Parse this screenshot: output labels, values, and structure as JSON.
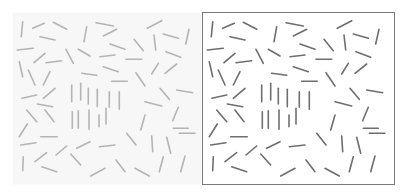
{
  "figure": {
    "panels": [
      {
        "id": "left",
        "stroke": "#b4b4b4",
        "border": false,
        "background": "#f7f7f7"
      },
      {
        "id": "right",
        "stroke": "#6e6e6e",
        "border": true,
        "border_color": "#7a7a7a",
        "background": "#ffffff"
      }
    ]
  },
  "segments": [
    [
      10.7,
      9.7,
      9.3,
      24.7
    ],
    [
      20.7,
      16.3,
      32.3,
      11.3
    ],
    [
      41.3,
      10.3,
      54.7,
      17.3
    ],
    [
      28,
      24.7,
      43,
      28
    ],
    [
      74.7,
      14.7,
      72,
      29.7
    ],
    [
      84,
      10.7,
      101.3,
      14
    ],
    [
      91.3,
      24,
      104.7,
      17.3
    ],
    [
      135.3,
      16.3,
      149.7,
      8.7
    ],
    [
      142,
      23,
      143.7,
      38
    ],
    [
      151.3,
      22,
      166.3,
      26.3
    ],
    [
      177,
      17.3,
      173.7,
      32
    ],
    [
      5.3,
      38,
      21.3,
      36.3
    ],
    [
      22,
      50.7,
      33,
      41.3
    ],
    [
      34,
      50.7,
      49.7,
      48.7
    ],
    [
      54,
      37.3,
      61.3,
      51.3
    ],
    [
      66.3,
      37.3,
      78,
      44
    ],
    [
      88,
      44.7,
      103,
      43
    ],
    [
      98,
      32,
      113,
      37.3
    ],
    [
      122,
      27.3,
      131.3,
      38.7
    ],
    [
      114,
      47.3,
      129.7,
      47.3
    ],
    [
      154,
      39.7,
      168.7,
      45.3
    ],
    [
      7.3,
      49.7,
      10.7,
      64.7
    ],
    [
      16.3,
      58,
      23,
      73
    ],
    [
      31.3,
      73,
      38,
      59.7
    ],
    [
      91.3,
      54.7,
      106.3,
      59.7
    ],
    [
      69.7,
      61.3,
      84.7,
      63.3
    ],
    [
      99.7,
      69.3,
      115.3,
      69.3
    ],
    [
      124,
      60.7,
      133,
      74
    ],
    [
      139.7,
      62,
      146.3,
      51.3
    ],
    [
      153,
      61.3,
      164.7,
      52
    ],
    [
      10,
      86.3,
      24.7,
      83
    ],
    [
      31.3,
      86.3,
      43,
      76.3
    ],
    [
      25.3,
      92,
      40.7,
      94.7
    ],
    [
      14.7,
      98,
      24.7,
      109.7
    ],
    [
      33,
      98,
      42,
      109.7
    ],
    [
      7.3,
      124.7,
      15.3,
      112
    ],
    [
      28.7,
      124.7,
      45.3,
      124.7
    ],
    [
      8.7,
      133,
      24,
      130.7
    ],
    [
      148,
      76.3,
      157.3,
      87.3
    ],
    [
      164.7,
      78,
      180.7,
      80.7
    ],
    [
      133,
      89.7,
      149.7,
      94
    ],
    [
      160.7,
      108.7,
      166.3,
      95.3
    ],
    [
      128.7,
      118,
      133,
      103
    ],
    [
      161.3,
      116.3,
      176.3,
      116.3
    ],
    [
      167.3,
      121.3,
      183,
      121.3
    ],
    [
      114.7,
      121.3,
      124,
      133
    ],
    [
      139.7,
      124,
      140.7,
      139.7
    ],
    [
      154.7,
      125.3,
      158.7,
      141.3
    ],
    [
      64.7,
      136.3,
      78,
      129.7
    ],
    [
      87.3,
      134.7,
      103,
      133
    ],
    [
      44,
      143,
      54.7,
      134
    ],
    [
      23,
      149.7,
      34.7,
      140.7
    ],
    [
      11.3,
      144.7,
      10.7,
      158.7
    ],
    [
      29.7,
      154.7,
      44.7,
      159.7
    ],
    [
      58.7,
      142,
      68.7,
      153
    ],
    [
      78.7,
      164,
      93,
      156.3
    ],
    [
      104,
      148,
      113,
      159.7
    ],
    [
      123,
      156.3,
      137.3,
      164
    ],
    [
      147.3,
      159.7,
      151.3,
      144.7
    ],
    [
      168.7,
      159.7,
      173,
      144
    ]
  ],
  "vertical_segments": [
    [
      59.7,
      73,
      59.7,
      89.7
    ],
    [
      68.7,
      71.3,
      68.7,
      88
    ],
    [
      76.3,
      76.3,
      76.3,
      92
    ],
    [
      85.3,
      77.3,
      85.3,
      94.7
    ],
    [
      97.3,
      79.7,
      97.3,
      95.3
    ],
    [
      107.3,
      79.7,
      107.3,
      97.3
    ],
    [
      60.3,
      99.7,
      60.3,
      116.3
    ],
    [
      66.3,
      98.7,
      66.3,
      116.3
    ],
    [
      77,
      98,
      77,
      117.3
    ],
    [
      87,
      103,
      87,
      114.7
    ],
    [
      94,
      96.3,
      94,
      112
    ]
  ]
}
